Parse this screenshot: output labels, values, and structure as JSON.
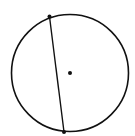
{
  "diagram": {
    "canvas": {
      "width": 135,
      "height": 136,
      "background": "#ffffff"
    },
    "stroke_color": "#111111",
    "circle": {
      "cx": 70,
      "cy": 73,
      "r": 58.5,
      "stroke_width": 1.6
    },
    "center_point": {
      "x": 70,
      "y": 73,
      "r": 2
    },
    "chord": {
      "start": {
        "x": 49.5,
        "y": 16.5
      },
      "end": {
        "x": 64,
        "y": 132
      },
      "stroke_width": 1.4
    },
    "endpoints": [
      {
        "x": 49.5,
        "y": 16.5,
        "r": 2
      },
      {
        "x": 64,
        "y": 132,
        "r": 2
      }
    ]
  }
}
